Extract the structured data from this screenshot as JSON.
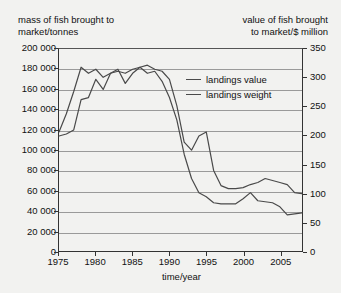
{
  "chart_data": {
    "type": "line",
    "title": "",
    "xlabel": "time/year",
    "ylabel_left": "mass of fish brought to\nmarket/tonnes",
    "ylabel_right": "value of fish brought\nto market/$ million",
    "grid": true,
    "legend_position": "inside-top-right",
    "xlim": [
      1975,
      2008
    ],
    "x_ticks": [
      1975,
      1980,
      1985,
      1990,
      1995,
      2000,
      2005
    ],
    "ylim_left": [
      0,
      200000
    ],
    "y_ticks_left": [
      0,
      20000,
      40000,
      60000,
      80000,
      100000,
      120000,
      140000,
      160000,
      180000,
      200000
    ],
    "y_tick_labels_left": [
      "0",
      "20 000",
      "40 000",
      "60 000",
      "80 000",
      "100 000",
      "120 000",
      "140 000",
      "160 000",
      "180 000",
      "200 000"
    ],
    "ylim_right": [
      0,
      350
    ],
    "y_ticks_right": [
      0,
      50,
      100,
      150,
      200,
      250,
      300,
      350
    ],
    "y_tick_labels_right": [
      "0",
      "50",
      "100",
      "150",
      "200",
      "250",
      "300",
      "350"
    ],
    "x": [
      1975,
      1976,
      1977,
      1978,
      1979,
      1980,
      1981,
      1982,
      1983,
      1984,
      1985,
      1986,
      1987,
      1988,
      1989,
      1990,
      1991,
      1992,
      1993,
      1994,
      1995,
      1996,
      1997,
      1998,
      1999,
      2000,
      2001,
      2002,
      2003,
      2004,
      2005,
      2006,
      2007,
      2008
    ],
    "series": [
      {
        "name": "landings value",
        "axis": "right",
        "unit": "$ million",
        "color": "#4a4a4a",
        "values_left_scale": [
          118000,
          136000,
          158000,
          182000,
          176000,
          180000,
          172000,
          176000,
          178000,
          176000,
          180000,
          182000,
          184000,
          180000,
          178000,
          170000,
          144000,
          108000,
          100000,
          114000,
          118000,
          80000,
          65000,
          62000,
          62000,
          63000,
          66000,
          68000,
          72000,
          70000,
          68000,
          66000,
          58000,
          57000
        ],
        "values": [
          207,
          238,
          277,
          319,
          308,
          315,
          301,
          308,
          312,
          308,
          315,
          319,
          322,
          315,
          312,
          298,
          252,
          189,
          175,
          200,
          207,
          140,
          114,
          109,
          109,
          110,
          116,
          119,
          126,
          123,
          119,
          116,
          102,
          100
        ]
      },
      {
        "name": "landings weight",
        "axis": "left",
        "unit": "tonnes",
        "color": "#4a4a4a",
        "values": [
          114000,
          116000,
          120000,
          150000,
          152000,
          170000,
          160000,
          176000,
          180000,
          166000,
          176000,
          182000,
          176000,
          178000,
          168000,
          152000,
          130000,
          96000,
          72000,
          58000,
          54000,
          48000,
          47000,
          47000,
          47000,
          52000,
          58000,
          50000,
          49000,
          48000,
          44000,
          36000,
          37000,
          38000
        ]
      }
    ]
  },
  "legend": {
    "items": [
      {
        "label": "landings value"
      },
      {
        "label": "landings weight"
      }
    ]
  },
  "axis_captions": {
    "left": "mass of fish brought to\nmarket/tonnes",
    "right": "value of fish brought\nto market/$ million"
  }
}
